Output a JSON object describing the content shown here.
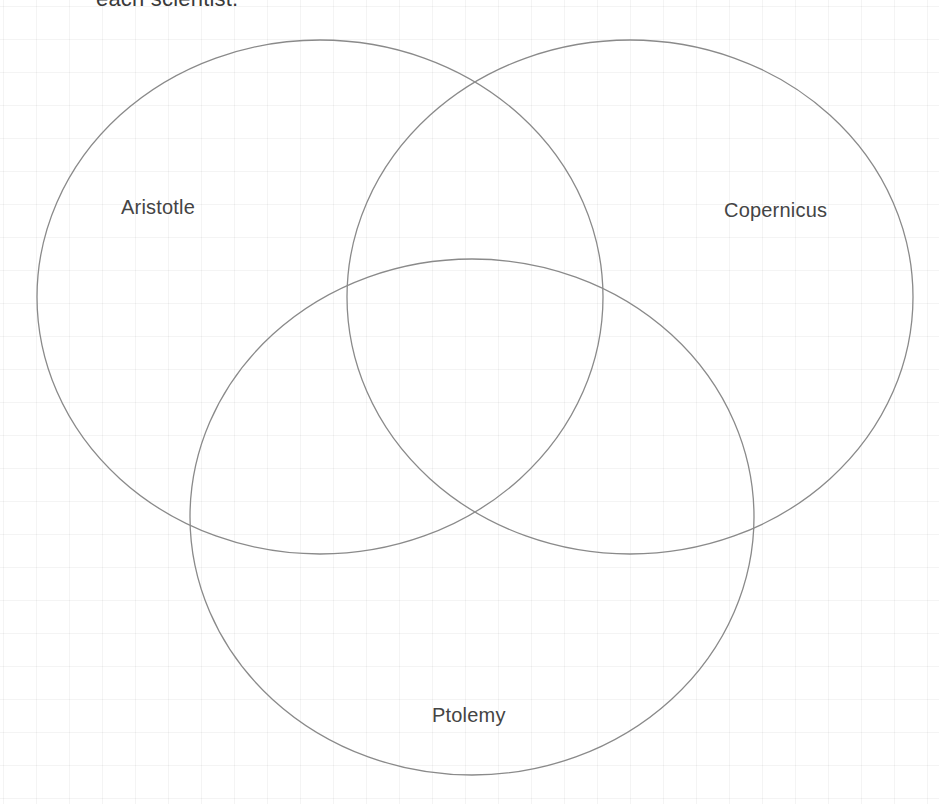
{
  "instruction": {
    "text": "each scientist."
  },
  "diagram": {
    "type": "venn",
    "sets": [
      {
        "id": "aristotle",
        "label": "Aristotle",
        "cx": 320,
        "cy": 297,
        "rx": 283,
        "ry": 257
      },
      {
        "id": "copernicus",
        "label": "Copernicus",
        "cx": 630,
        "cy": 297,
        "rx": 283,
        "ry": 257
      },
      {
        "id": "ptolemy",
        "label": "Ptolemy",
        "cx": 472,
        "cy": 517,
        "rx": 282,
        "ry": 258
      }
    ],
    "stroke_color": "#8a8a8a",
    "background": "grid"
  }
}
